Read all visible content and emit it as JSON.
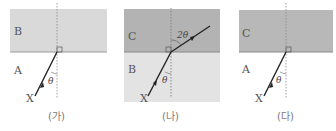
{
  "panels": [
    {
      "caption": "(가)",
      "upper_medium": "B",
      "lower_medium": "A",
      "ray_label": "X",
      "incident_angle": "θ",
      "upper_color": "#d9d9d9",
      "lower_color": "#ffffff",
      "refracted": false
    },
    {
      "caption": "(나)",
      "upper_medium": "C",
      "lower_medium": "B",
      "ray_label": "X",
      "incident_angle": "θ",
      "refracted_angle": "2θ",
      "upper_color": "#b3b3b3",
      "lower_color": "#e3e3e3",
      "refracted": true
    },
    {
      "caption": "(다)",
      "upper_medium": "C",
      "lower_medium": "A",
      "ray_label": "X",
      "incident_angle": "θ",
      "upper_color": "#b8b8b8",
      "lower_color": "#ffffff",
      "refracted": false
    }
  ]
}
